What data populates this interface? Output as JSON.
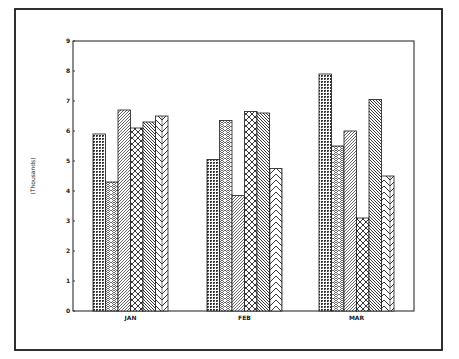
{
  "chart_data": {
    "type": "bar",
    "title": "",
    "xlabel": "",
    "ylabel": "(Thousands)",
    "ylim": [
      0,
      9
    ],
    "yticks": [
      "0",
      "1",
      "2",
      "3",
      "4",
      "5",
      "6",
      "7",
      "8",
      "9"
    ],
    "grid": false,
    "legend": "none",
    "categories": [
      "JAN",
      "FEB",
      "MAR"
    ],
    "series": [
      {
        "name": "Series 1",
        "pattern": "dense-crosshatch",
        "values": [
          5.9,
          5.05,
          7.9
        ]
      },
      {
        "name": "Series 2",
        "pattern": "dense-herringbone",
        "values": [
          4.3,
          6.35,
          5.5
        ]
      },
      {
        "name": "Series 3",
        "pattern": "dense-diagonal",
        "values": [
          6.7,
          3.85,
          6.0
        ]
      },
      {
        "name": "Series 4",
        "pattern": "open-crosshatch",
        "values": [
          6.1,
          6.65,
          3.1
        ]
      },
      {
        "name": "Series 5",
        "pattern": "wide-backslash",
        "values": [
          6.3,
          6.6,
          7.05
        ]
      },
      {
        "name": "Series 6",
        "pattern": "wide-chevron",
        "values": [
          6.5,
          4.75,
          4.5
        ]
      }
    ]
  },
  "colors": {
    "ink": "#1a1a1a",
    "background": "#ffffff"
  }
}
